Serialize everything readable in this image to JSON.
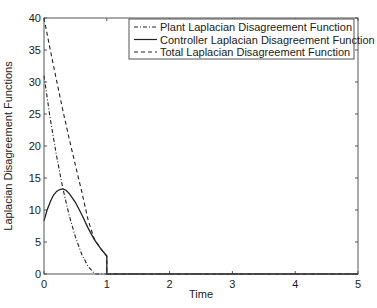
{
  "chart_data": {
    "type": "line",
    "title": "",
    "xlabel": "Time",
    "ylabel": "Laplacian Disagreement Functions",
    "xlim": [
      0,
      5
    ],
    "ylim": [
      0,
      40
    ],
    "xticks": [
      0,
      1,
      2,
      3,
      4,
      5
    ],
    "yticks": [
      0,
      5,
      10,
      15,
      20,
      25,
      30,
      35,
      40
    ],
    "grid": false,
    "legend_position": "upper right",
    "series": [
      {
        "name": "Plant Laplacian Disagreement Function",
        "style": "dash-dot",
        "color": "#222222",
        "x": [
          0,
          0.1,
          0.2,
          0.3,
          0.4,
          0.5,
          0.6,
          0.7,
          0.8,
          0.83,
          1,
          2,
          3,
          4,
          5
        ],
        "y": [
          31,
          24.2,
          18.4,
          13.4,
          9.2,
          5.8,
          3.1,
          1.2,
          0.15,
          0,
          0,
          0,
          0,
          0,
          0
        ]
      },
      {
        "name": "Controller Laplacian Disagreement Function",
        "style": "solid",
        "color": "#222222",
        "x": [
          0,
          0.05,
          0.1,
          0.15,
          0.2,
          0.25,
          0.3,
          0.35,
          0.4,
          0.5,
          0.6,
          0.7,
          0.8,
          0.9,
          1.0,
          1.0,
          2,
          3,
          4,
          5
        ],
        "y": [
          8.3,
          10.0,
          11.3,
          12.3,
          12.9,
          13.2,
          13.3,
          13.1,
          12.6,
          11.2,
          9.3,
          7.2,
          5.4,
          4.0,
          2.8,
          0,
          0,
          0,
          0,
          0
        ]
      },
      {
        "name": "Total Laplacian Disagreement Function",
        "style": "dashed",
        "color": "#222222",
        "x": [
          0,
          0.1,
          0.2,
          0.3,
          0.4,
          0.5,
          0.6,
          0.7,
          0.8,
          0.9,
          1.0,
          1.0,
          2,
          3,
          4,
          5
        ],
        "y": [
          40,
          35.0,
          30.2,
          25.6,
          21.2,
          17.0,
          12.9,
          8.5,
          5.5,
          4.0,
          2.8,
          0,
          0,
          0,
          0,
          0
        ]
      }
    ]
  }
}
